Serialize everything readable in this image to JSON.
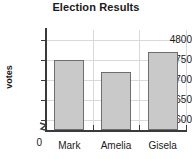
{
  "chart_data": {
    "type": "bar",
    "title": "Election Results",
    "xlabel": "",
    "ylabel": "votes",
    "categories": [
      "Mark",
      "Amelia",
      "Gisela"
    ],
    "values": [
      4750,
      4720,
      4770
    ],
    "series": [
      {
        "name": "votes",
        "values": [
          4750,
          4720,
          4770
        ]
      }
    ],
    "ylim": [
      4575,
      4825
    ],
    "y_ticks": [
      4600,
      4650,
      4700,
      4750,
      4800
    ],
    "y_tick_labels": [
      "4600",
      "4650",
      "4700",
      "4750",
      "4800"
    ],
    "zero_label": "0",
    "axis_break": true,
    "grid": true,
    "legend": false,
    "legend_position": "none",
    "bar_color": "#c9c9c9",
    "bar_edge_color": "#6e6e6e",
    "grid_color": "#d9d9d9",
    "axis_color": "#3a3a3a",
    "background": "#ffffff"
  },
  "axis": {
    "y_title": "votes",
    "zero_tick": "0"
  }
}
